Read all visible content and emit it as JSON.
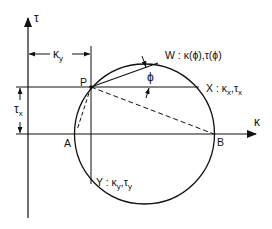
{
  "diagram": {
    "type": "mohr-circle",
    "colors": {
      "ink": "#111111",
      "background": "#ffffff"
    },
    "axes": {
      "vertical_label": "τ",
      "horizontal_label": "κ"
    },
    "points": {
      "P": {
        "label": "P"
      },
      "A": {
        "label": "A"
      },
      "B": {
        "label": "B"
      },
      "W": {
        "label": "W : κ(ϕ),τ(ϕ)",
        "name": "W",
        "coords": "κ(ϕ),τ(ϕ)"
      },
      "X": {
        "label": "X : κx,τx",
        "name": "X",
        "k": "κ",
        "k_sub": "x",
        "t": "τ",
        "t_sub": "x"
      },
      "Y": {
        "label": "Y : κy,τy",
        "name": "Y",
        "k": "κ",
        "k_sub": "y",
        "t": "τ",
        "t_sub": "y"
      }
    },
    "dimensions": {
      "ky": {
        "symbol": "κ",
        "sub": "y"
      },
      "tx": {
        "symbol": "τ",
        "sub": "x"
      }
    },
    "angle": {
      "symbol": "ϕ"
    },
    "separators": {
      "colon": ":",
      "comma": ","
    }
  }
}
